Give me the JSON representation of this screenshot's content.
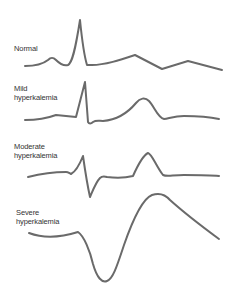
{
  "diagram": {
    "stroke_color": "#6a6a6a",
    "text_color": "#333333",
    "traces": [
      {
        "id": "normal",
        "label_lines": [
          "Normal"
        ],
        "path": "M25,66 C35,66 43,64 48,60 C51,57 53,57 56,60 C60,64 64,66 68,65 C72,63 75,52 80,20 C82,40 84,55 87,65 L92,65 C105,65 120,60 135,55 L162,69 L188,61 L222,70"
      },
      {
        "id": "mild",
        "label_lines": [
          "Mild",
          "hyperkalemia"
        ],
        "path": "M25,120 C38,120 48,118 56,115 L76,117 L85,82 L88,122 C89,124 91,124 93,122 C96,120 99,121 103,121 C115,120 126,115 136,103 C140,98 145,97 149,101 C154,106 158,118 164,119 C170,118 175,116 184,116 C198,116 210,117 219,119"
      },
      {
        "id": "moderate",
        "label_lines": [
          "Moderate",
          "hyperkalemia"
        ],
        "path": "M28,177 C40,174 55,172 66,172 C68,172 69,173 71,174 C75,172 79,166 83,156 C85,170 88,188 90,197 C93,190 96,182 100,178 C102,176 104,176 107,177 C115,178 125,178 133,176 C137,167 142,156 148,153 C152,154 156,166 163,175 C167,177 172,175 184,175 C198,175 210,175 219,176"
      },
      {
        "id": "severe",
        "label_lines": [
          "Severe",
          "hyperkalemia"
        ],
        "path": "M29,233 C45,239 62,237 78,232 C84,236 90,251 93,264 C97,278 102,283 107,281 C113,279 117,266 124,245 C132,222 142,199 152,195 C158,193 164,193 170,200 C180,209 200,225 219,239"
      }
    ]
  }
}
